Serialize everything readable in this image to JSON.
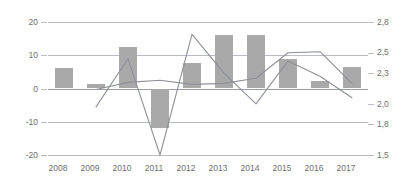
{
  "chart_data": {
    "type": "bar",
    "title": "",
    "subtitle": "",
    "xlabel": "",
    "ylabel": "",
    "categories": [
      "2008",
      "2009",
      "2010",
      "2011",
      "2012",
      "2013",
      "2014",
      "2015",
      "2016",
      "2017"
    ],
    "grid": true,
    "legend": "none",
    "axes": {
      "left": {
        "ticks": [
          "20",
          "10",
          "0",
          "-10",
          "-20"
        ],
        "values": [
          20,
          10,
          0,
          -10,
          -20
        ],
        "ylim": [
          -20,
          20
        ],
        "decimal_separator": "."
      },
      "right": {
        "ticks": [
          "2,8",
          "2,5",
          "2,3",
          "2,0",
          "1,8",
          "1,5"
        ],
        "values": [
          2.8,
          2.5,
          2.3,
          2.0,
          1.8,
          1.5
        ],
        "ylim": [
          1.5,
          2.8
        ],
        "decimal_separator": ","
      }
    },
    "series": [
      {
        "name": "bars",
        "type": "bar",
        "axis": "left",
        "color": "#a9a9a9",
        "values": [
          6.3,
          1.5,
          12.6,
          -12.0,
          7.6,
          16.0,
          16.0,
          9.0,
          2.2,
          6.6
        ]
      },
      {
        "name": "line-volatile",
        "type": "line",
        "axis": "right",
        "color": "#8f9199",
        "values": [
          null,
          1.97,
          2.44,
          1.5,
          2.68,
          2.3,
          2.0,
          2.42,
          2.27,
          2.06
        ]
      },
      {
        "name": "line-flat",
        "type": "line",
        "axis": "right",
        "color": "#8f9199",
        "values": [
          null,
          2.14,
          2.21,
          2.23,
          2.19,
          2.2,
          2.25,
          2.5,
          2.51,
          2.2
        ]
      }
    ]
  }
}
